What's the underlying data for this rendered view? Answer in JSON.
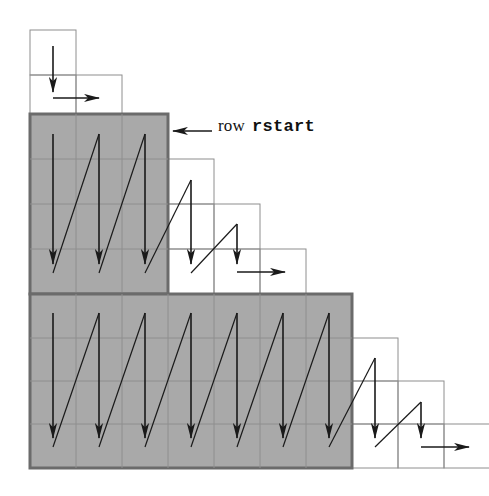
{
  "figure": {
    "canvas": {
      "width": 489,
      "height": 496,
      "background": "#ffffff"
    },
    "annotation": {
      "leader_arrow_name": "leader-arrow-left",
      "label_word": "row",
      "label_code": "rstart"
    },
    "colors": {
      "shade_fill": "#a9a9a9",
      "shade_border": "#6b6b6b",
      "cell_stroke": "#8e8e8e",
      "arrow": "#1a1a1a",
      "background": "#ffffff"
    },
    "geometry": {
      "origin_x": 30,
      "origin_y": 30,
      "cell_width": 46,
      "cell_height": 45,
      "columns": 9,
      "rows": 10
    },
    "blocks": [
      {
        "name": "block-row0",
        "shaded": false,
        "col_start": 0,
        "col_count": 1,
        "row_start": 0,
        "row_count": 1,
        "label": "unshaded block row 0"
      },
      {
        "name": "block-row1",
        "shaded": false,
        "col_start": 0,
        "col_count": 2,
        "row_start": 1,
        "row_count": 1,
        "label": "unshaded block row 1"
      },
      {
        "name": "block-rstart-shaded",
        "shaded": true,
        "col_start": 0,
        "col_count": 3,
        "row_start": 2,
        "row_count": 4,
        "label": "shaded block rstart (3 columns x 4 rows)"
      },
      {
        "name": "block-step-col3",
        "shaded": false,
        "col_start": 3,
        "col_count": 1,
        "row_start": 3,
        "row_count": 3,
        "label": "unshaded step column 3"
      },
      {
        "name": "block-step-col4",
        "shaded": false,
        "col_start": 4,
        "col_count": 1,
        "row_start": 4,
        "row_count": 2,
        "label": "unshaded step column 4"
      },
      {
        "name": "block-step-col5",
        "shaded": false,
        "col_start": 5,
        "col_count": 1,
        "row_start": 5,
        "row_count": 1,
        "label": "unshaded step column 5"
      },
      {
        "name": "block-lower-shaded",
        "shaded": true,
        "col_start": 0,
        "col_count": 7,
        "row_start": 6,
        "row_count": 4,
        "label": "shaded lower block (7 columns x 4 rows)"
      },
      {
        "name": "block-step-col7",
        "shaded": false,
        "col_start": 7,
        "col_count": 1,
        "row_start": 7,
        "row_count": 3,
        "label": "unshaded step column 7"
      },
      {
        "name": "block-step-col8",
        "shaded": false,
        "col_start": 8,
        "col_count": 1,
        "row_start": 8,
        "row_count": 2,
        "label": "unshaded step column 8"
      },
      {
        "name": "block-step-col9",
        "shaded": false,
        "col_start": 9,
        "col_count": 1,
        "row_start": 9,
        "row_count": 1,
        "label": "unshaded step column 9"
      }
    ],
    "traversal": {
      "description": "Column-major zigzag sweep: a down arrow through each column, a diagonal return up to the top of the next column, and a horizontal hand-off arrow at the end of each band.",
      "bands": [
        {
          "name": "band-top",
          "down_arrow_columns": 1,
          "handoff": "right"
        },
        {
          "name": "band-rstart",
          "down_arrow_columns": 5,
          "handoff": "right"
        },
        {
          "name": "band-lower",
          "down_arrow_columns": 9,
          "handoff": "right"
        }
      ]
    }
  }
}
